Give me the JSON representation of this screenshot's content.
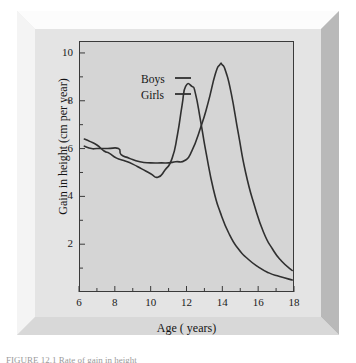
{
  "figure": {
    "caption": "FIGURE 12.1  Rate of gain in height"
  },
  "axes": {
    "y_title": "Gain in height (cm per year)",
    "x_title": "Age ( years)",
    "y_ticks": [
      "2",
      "4",
      "6",
      "8",
      "10"
    ],
    "x_ticks": [
      "6",
      "8",
      "10",
      "12",
      "14",
      "16",
      "18"
    ]
  },
  "legend": {
    "items": [
      {
        "label": "Boys",
        "swatch": "line-swatch"
      },
      {
        "label": "Girls",
        "swatch": "line-swatch"
      }
    ]
  },
  "colors": {
    "plot_background": "#d5d5d5",
    "frame_background": "#e4e4e4",
    "page_background": "#ffffff",
    "line": "#303030",
    "axis": "#3a3a3a"
  },
  "chart_data": {
    "type": "line",
    "title": "",
    "xlabel": "Age ( years)",
    "ylabel": "Gain in height (cm per year)",
    "xlim": [
      6,
      18
    ],
    "ylim": [
      0,
      10.5
    ],
    "grid": false,
    "legend_position": "upper-left-inside",
    "x_major_ticks": [
      6,
      8,
      10,
      12,
      14,
      16,
      18
    ],
    "x_minor_ticks": [
      7,
      9,
      11,
      13,
      15,
      17
    ],
    "y_major_ticks": [
      2,
      4,
      6,
      8,
      10
    ],
    "y_minor_ticks": [
      1,
      3,
      5,
      7,
      9
    ],
    "series": [
      {
        "name": "Boys",
        "peak_age": 13.9,
        "peak_value": 9.5,
        "x": [
          6.3,
          6.7,
          7.0,
          7.6,
          8.2,
          8.35,
          8.8,
          9.4,
          10.0,
          10.6,
          11.0,
          11.4,
          11.9,
          12.3,
          12.8,
          13.2,
          13.6,
          13.85,
          14.0,
          14.2,
          14.5,
          14.9,
          15.3,
          15.8,
          16.3,
          16.8,
          17.3,
          17.9
        ],
        "y": [
          6.1,
          6.0,
          6.0,
          6.0,
          6.0,
          5.75,
          5.6,
          5.45,
          5.4,
          5.4,
          5.4,
          5.45,
          5.5,
          5.9,
          6.9,
          7.9,
          9.1,
          9.5,
          9.5,
          9.2,
          8.3,
          6.6,
          5.0,
          3.6,
          2.5,
          1.8,
          1.3,
          0.9
        ]
      },
      {
        "name": "Girls",
        "peak_age": 12.1,
        "peak_value": 8.6,
        "x": [
          6.3,
          6.6,
          7.0,
          7.4,
          7.7,
          8.1,
          8.5,
          9.0,
          9.5,
          10.0,
          10.4,
          10.8,
          11.2,
          11.5,
          11.75,
          11.95,
          12.3,
          12.5,
          12.8,
          13.1,
          13.5,
          13.9,
          14.4,
          14.9,
          15.4,
          16.0,
          16.6,
          17.2,
          17.9
        ],
        "y": [
          6.4,
          6.3,
          6.15,
          5.9,
          5.8,
          5.6,
          5.5,
          5.35,
          5.15,
          4.95,
          4.8,
          5.1,
          5.6,
          6.6,
          7.8,
          8.6,
          8.6,
          8.3,
          7.1,
          5.8,
          4.3,
          3.3,
          2.4,
          1.8,
          1.4,
          1.05,
          0.8,
          0.65,
          0.5
        ]
      }
    ]
  }
}
